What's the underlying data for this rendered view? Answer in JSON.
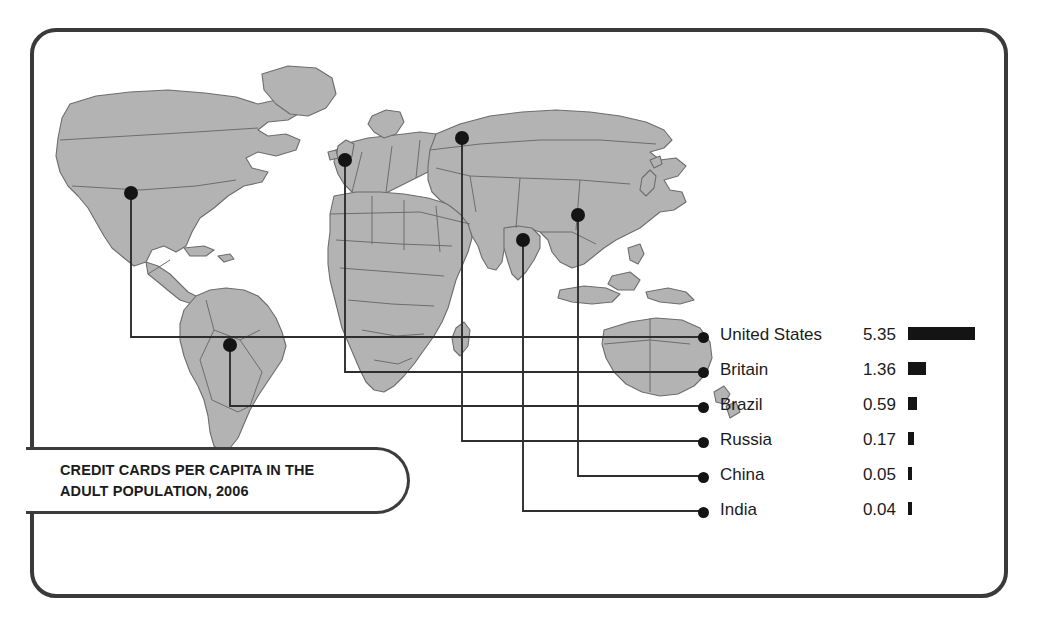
{
  "title": {
    "line1": "CREDIT CARDS PER CAPITA IN THE",
    "line2": "ADULT POPULATION, 2006",
    "full": "CREDIT CARDS PER CAPITA IN THE\nADULT POPULATION, 2006"
  },
  "chart_data": {
    "type": "bar",
    "title": "CREDIT CARDS PER CAPITA IN THE ADULT POPULATION, 2006",
    "xlabel": "",
    "ylabel": "",
    "unit": "credit cards per capita",
    "year": "2006",
    "grid": false,
    "legend_position": "right",
    "orientation": "horizontal",
    "categories": [
      "United States",
      "Britain",
      "Brazil",
      "Russia",
      "China",
      "India"
    ],
    "values": [
      5.35,
      1.36,
      0.59,
      0.17,
      0.05,
      0.04
    ],
    "value_labels": [
      "5.35",
      "1.36",
      "0.59",
      "0.17",
      "0.05",
      "0.04"
    ],
    "xlim": [
      0,
      5.35
    ],
    "bar_color": "#141414",
    "map_markers": [
      {
        "name": "United States",
        "x": 131,
        "y": 193
      },
      {
        "name": "Britain",
        "x": 345,
        "y": 160
      },
      {
        "name": "Brazil",
        "x": 230,
        "y": 345
      },
      {
        "name": "Russia",
        "x": 462,
        "y": 138
      },
      {
        "name": "China",
        "x": 578,
        "y": 215
      },
      {
        "name": "India",
        "x": 523,
        "y": 240
      }
    ]
  },
  "legend": [
    {
      "country": "United States",
      "value": "5.35",
      "bar_px": 67
    },
    {
      "country": "Britain",
      "value": "1.36",
      "bar_px": 18
    },
    {
      "country": "Brazil",
      "value": "0.59",
      "bar_px": 9
    },
    {
      "country": "Russia",
      "value": "0.17",
      "bar_px": 6
    },
    {
      "country": "China",
      "value": "0.05",
      "bar_px": 4
    },
    {
      "country": "India",
      "value": "0.04",
      "bar_px": 4
    }
  ],
  "colors": {
    "frame": "#3a3a3a",
    "land": "#b3b3b3",
    "land_border": "#6d6d6d",
    "marker": "#141414",
    "leader": "#2e2e2e",
    "text": "#1b1b1b",
    "background": "#ffffff"
  }
}
